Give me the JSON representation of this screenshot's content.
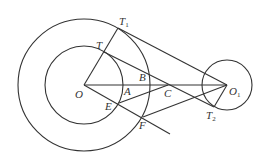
{
  "diagram": {
    "type": "geometry",
    "stroke_color": "#333333",
    "background": "#ffffff",
    "circles": [
      {
        "id": "outer-O",
        "center": "O",
        "cx": 84,
        "cy": 85,
        "r": 66
      },
      {
        "id": "inner-O",
        "center": "O",
        "cx": 84,
        "cy": 85,
        "r": 39
      },
      {
        "id": "circle-O1",
        "center": "O1",
        "cx": 227,
        "cy": 85,
        "r": 25
      }
    ],
    "points": {
      "O": {
        "x": 84,
        "y": 85
      },
      "O1": {
        "x": 227,
        "y": 85
      },
      "T": {
        "x": 104,
        "y": 52
      },
      "T1": {
        "x": 118,
        "y": 28
      },
      "T2": {
        "x": 214,
        "y": 107
      },
      "A": {
        "x": 123,
        "y": 85
      },
      "B": {
        "x": 150,
        "y": 80
      },
      "C": {
        "x": 168,
        "y": 85
      },
      "E": {
        "x": 119,
        "y": 103
      },
      "F": {
        "x": 143,
        "y": 117
      }
    },
    "segments": [
      [
        "O",
        "T1"
      ],
      [
        "T1",
        "O1"
      ],
      [
        "T",
        "T2"
      ],
      [
        "O",
        "O1"
      ],
      [
        "O",
        "F_ext"
      ],
      [
        "E",
        "C"
      ],
      [
        "F",
        "O1"
      ],
      [
        "O1",
        "T2"
      ]
    ],
    "labels": [
      {
        "text": "T",
        "sub": "1",
        "x": 119,
        "y": 25
      },
      {
        "text": "T",
        "sub": "",
        "x": 96,
        "y": 49
      },
      {
        "text": "B",
        "sub": "",
        "x": 139,
        "y": 81
      },
      {
        "text": "O",
        "sub": "",
        "x": 75,
        "y": 98
      },
      {
        "text": "A",
        "sub": "",
        "x": 124,
        "y": 95
      },
      {
        "text": "C",
        "sub": "",
        "x": 164,
        "y": 97
      },
      {
        "text": "O",
        "sub": "1",
        "x": 229,
        "y": 95
      },
      {
        "text": "E",
        "sub": "",
        "x": 105,
        "y": 110
      },
      {
        "text": "F",
        "sub": "",
        "x": 139,
        "y": 129
      },
      {
        "text": "T",
        "sub": "2",
        "x": 206,
        "y": 119
      }
    ]
  }
}
